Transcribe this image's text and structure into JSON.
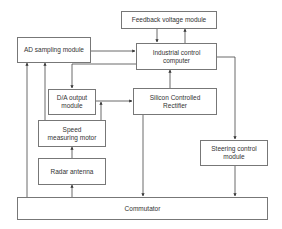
{
  "diagram": {
    "type": "block-diagram",
    "nodes": {
      "feedback": "Feedback voltage module",
      "ad": "AD sampling module",
      "computer": "Industrial control computer",
      "da": "D/A output module",
      "scr": "Silicon Controlled Rectifier",
      "speed": "Speed measuring motor",
      "radar": "Radar antenna",
      "steering": "Steering control module",
      "commutator": "Commutator"
    },
    "edges": [
      {
        "from": "feedback",
        "to": "computer"
      },
      {
        "from": "computer",
        "to": "feedback"
      },
      {
        "from": "ad",
        "to": "computer"
      },
      {
        "from": "computer",
        "to": "da"
      },
      {
        "from": "da",
        "to": "scr"
      },
      {
        "from": "speed",
        "to": "da"
      },
      {
        "from": "scr",
        "to": "computer"
      },
      {
        "from": "scr",
        "to": "commutator"
      },
      {
        "from": "computer",
        "to": "steering"
      },
      {
        "from": "steering",
        "to": "commutator"
      },
      {
        "from": "radar",
        "to": "speed"
      },
      {
        "from": "commutator",
        "to": "radar"
      },
      {
        "from": "speed",
        "to": "ad"
      },
      {
        "from": "commutator",
        "to": "ad"
      }
    ]
  }
}
